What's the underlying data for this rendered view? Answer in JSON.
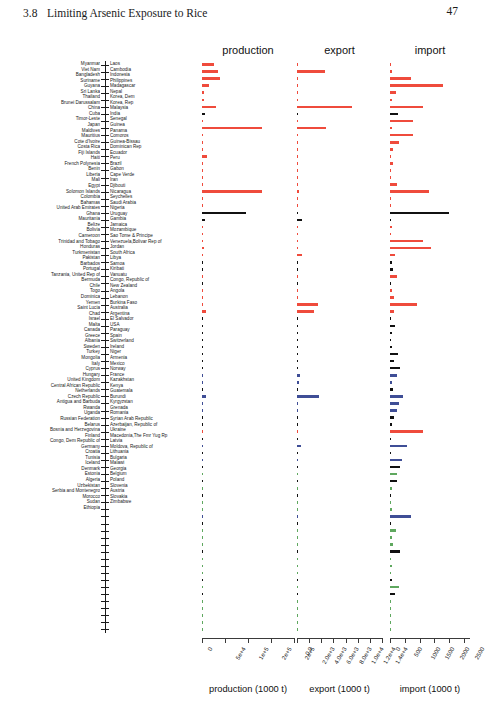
{
  "page": {
    "chapter_number": "3.8",
    "chapter_title": "Limiting Arsenic Exposure to Rice",
    "page_number": "47"
  },
  "figure": {
    "panels": [
      {
        "key": "production",
        "title": "production",
        "caption": "production (1000 t)"
      },
      {
        "key": "export",
        "title": "export",
        "caption": "export (1000 t)"
      },
      {
        "key": "import",
        "title": "import",
        "caption": "import (1000 t)"
      }
    ]
  },
  "chart_data": {
    "type": "bar",
    "orientation": "horizontal",
    "title": "",
    "subtitle": "",
    "panels": [
      {
        "name": "production",
        "xlabel": "production (1000 t)",
        "xlim": [
          0,
          200000
        ],
        "ticks": [
          0,
          50000,
          100000,
          150000,
          200000
        ],
        "ticklabels": [
          "0",
          "5e+4",
          "1e+5",
          "2e+5",
          "2e+5"
        ],
        "grid": false
      },
      {
        "name": "export",
        "xlabel": "export (1000 t)",
        "xlim": [
          0,
          14000
        ],
        "ticks": [
          0,
          2000,
          4000,
          6000,
          8000,
          10000,
          12000,
          14000
        ],
        "ticklabels": [
          "0.0",
          "2.0e+3",
          "4.0e+3",
          "6.0e+3",
          "8.0e+3",
          "1.0e+4",
          "1.2e+4",
          "1.4e+4"
        ],
        "grid": false
      },
      {
        "name": "import",
        "xlabel": "import (1000 t)",
        "xlim": [
          0,
          2700
        ],
        "ticks": [
          0,
          500,
          1000,
          1500,
          2000,
          2500
        ],
        "ticklabels": [
          "0",
          "500",
          "1000",
          "1500",
          "2000",
          "2500"
        ],
        "grid": false
      }
    ],
    "legend": {
      "position": "none",
      "entries": []
    },
    "colors": {
      "red": "#ef4b3c",
      "black": "#111111",
      "blue": "#3f4e96",
      "green": "#5fa85f"
    },
    "left_labels": [
      "Myanmar",
      "Viet Nam",
      "Bangladesh",
      "Suriname",
      "Guyana",
      "Sri Lanka",
      "Thailand",
      "Brunei Darussalam",
      "China",
      "Cuba",
      "Timor-Leste",
      "Japan",
      "Maldives",
      "Mauritius",
      "Cote d'Ivoire",
      "Costa Rica",
      "Fiji Islands",
      "Haiti",
      "French Polynesia",
      "Benin",
      "Liberia",
      "Mali",
      "Egypt",
      "Solomon Islands",
      "Colombia",
      "Bahamas",
      "United Arab Emirates",
      "Ghana",
      "Mauritania",
      "Belize",
      "Bolivia",
      "Cameroon",
      "Trinidad and Tobago",
      "Honduras",
      "Turkmenistan",
      "Pakistan",
      "Barbados",
      "Portugal",
      "Tanzania, United Rep of",
      "Bermuda",
      "Chile",
      "Togo",
      "Dominica",
      "Yemen",
      "Saint Lucia",
      "Chad",
      "Israel",
      "Malta",
      "Canada",
      "Greece",
      "Albania",
      "Sweden",
      "Turkey",
      "Mongolia",
      "Italy",
      "Cyprus",
      "Hungary",
      "United Kingdom",
      "Central African Republic",
      "Netherlands",
      "Czech Republic",
      "Antigua and Barbuda",
      "Rwanda",
      "Uganda",
      "Russian Federation",
      "Belarus",
      "Bosnia and Herzegovina",
      "Finland",
      "Congo, Dem Republic of",
      "Germany",
      "Croatia",
      "Tunisia",
      "Iceland",
      "Denmark",
      "Estonia",
      "Algeria",
      "Uzbekistan",
      "Serbia and Montenegro",
      "Morocco",
      "Sudan",
      "Ethiopia"
    ],
    "right_labels": [
      "Laos",
      "Cambodia",
      "Indonesia",
      "Philippines",
      "Madagascar",
      "Nepal",
      "Korea, Dem",
      "Korea, Rep",
      "Malaysia",
      "India",
      "Senegal",
      "Guinea",
      "Panama",
      "Comoros",
      "Guinea-Bissau",
      "Dominican Rep",
      "Ecuador",
      "Peru",
      "Brazil",
      "Gabon",
      "Cape Verde",
      "Iran",
      "Djibouti",
      "Nicaragua",
      "Seychelles",
      "Saudi Arabia",
      "Nigeria",
      "Uruguay",
      "Gambia",
      "Jamaica",
      "Mozambique",
      "Sao Tome & Principe",
      "Venezuela,Bolivar Rep of",
      "Jordan",
      "South Africa",
      "Libya",
      "Samoa",
      "Kiribati",
      "Vanuatu",
      "Congo, Republic of",
      "New Zealand",
      "Angola",
      "Lebanon",
      "Burkina Faso",
      "Australia",
      "Argentina",
      "El Salvador",
      "USA",
      "Paraguay",
      "Spain",
      "Switzerland",
      "Ireland",
      "Niger",
      "Armenia",
      "Mexico",
      "Norway",
      "France",
      "Kazakhstan",
      "Kenya",
      "Guatemala",
      "Burundi",
      "Kyrgyzstan",
      "Grenada",
      "Romania",
      "Syrian Arab Republic",
      "Azerbaijan, Republic of",
      "Ukraine",
      "Macedonia,The Fmr Yug Rp",
      "Latvia",
      "Moldova, Republic of",
      "Lithuania",
      "Bulgaria",
      "Malawi",
      "Georgia",
      "Belgium",
      "Poland",
      "Slovenia",
      "Austria",
      "Slovakia",
      "Zimbabwe"
    ],
    "rows": [
      {
        "left": "Myanmar",
        "right": "Laos",
        "color": "red",
        "production": 25200,
        "export": 60,
        "import": 30
      },
      {
        "left": "Viet Nam",
        "right": "Cambodia",
        "color": "red",
        "production": 35800,
        "export": 4600,
        "import": 80
      },
      {
        "left": "Bangladesh",
        "right": "Indonesia",
        "color": "red",
        "production": 40100,
        "export": 40,
        "import": 720
      },
      {
        "left": "Suriname",
        "right": "Philippines",
        "color": "red",
        "production": 15300,
        "export": 30,
        "import": 1800
      },
      {
        "left": "Guyana",
        "right": "Madagascar",
        "color": "red",
        "production": 3400,
        "export": 20,
        "import": 210
      },
      {
        "left": "Sri Lanka",
        "right": "Nepal",
        "color": "red",
        "production": 4200,
        "export": 15,
        "import": 70
      },
      {
        "left": "Thailand",
        "right": "Korea, Dem",
        "color": "red",
        "production": 29500,
        "export": 9000,
        "import": 1100
      },
      {
        "left": "Brunei Darussalam",
        "right": "Korea, Rep",
        "color": "black",
        "production": 6500,
        "export": 30,
        "import": 260
      },
      {
        "left": "China",
        "right": "Malaysia",
        "color": "red",
        "production": 2200,
        "export": 40,
        "import": 760
      },
      {
        "left": "Cuba",
        "right": "India",
        "color": "red",
        "production": 131000,
        "export": 4800,
        "import": 60
      },
      {
        "left": "Timor-Leste",
        "right": "Senegal",
        "color": "red",
        "production": 380,
        "export": 10,
        "import": 760
      },
      {
        "left": "Japan",
        "right": "Guinea",
        "color": "red",
        "production": 1400,
        "export": 5,
        "import": 290
      },
      {
        "left": "Maldives",
        "right": "Panama",
        "color": "red",
        "production": 330,
        "export": 5,
        "import": 100
      },
      {
        "left": "Mauritius",
        "right": "Comoros",
        "color": "red",
        "production": 11000,
        "export": 200,
        "import": 40
      },
      {
        "left": "Cote d'Ivoire",
        "right": "Guinea-Bissau",
        "color": "red",
        "production": 700,
        "export": 10,
        "import": 90
      },
      {
        "left": "Costa Rica",
        "right": "Dominican Rep",
        "color": "red",
        "production": 730,
        "export": 20,
        "import": 40
      },
      {
        "left": "Fiji Islands",
        "right": "Ecuador",
        "color": "red",
        "production": 1400,
        "export": 40,
        "import": 20
      },
      {
        "left": "Haiti",
        "right": "Peru",
        "color": "red",
        "production": 2400,
        "export": 30,
        "import": 220
      },
      {
        "left": "French Polynesia",
        "right": "Brazil",
        "color": "red",
        "production": 130000,
        "export": 300,
        "import": 1300
      },
      {
        "left": "Benin",
        "right": "Gabon",
        "color": "red",
        "production": 180,
        "export": 5,
        "import": 20
      },
      {
        "left": "Liberia",
        "right": "Cape Verde",
        "color": "red",
        "production": 210,
        "export": 5,
        "import": 30
      },
      {
        "left": "Mali",
        "right": "Iran",
        "color": "black",
        "production": 95000,
        "export": 120,
        "import": 2000
      },
      {
        "left": "Egypt",
        "right": "Djibouti",
        "color": "black",
        "production": 5900,
        "export": 900,
        "import": 30
      },
      {
        "left": "Solomon Islands",
        "right": "Nicaragua",
        "color": "red",
        "production": 300,
        "export": 10,
        "import": 70
      },
      {
        "left": "Colombia",
        "right": "Seychelles",
        "color": "red",
        "production": 2700,
        "export": 25,
        "import": 20
      },
      {
        "left": "Bahamas",
        "right": "Saudi Arabia",
        "color": "red",
        "production": 70,
        "export": 15,
        "import": 1100
      },
      {
        "left": "United Arab Emirates",
        "right": "Nigeria",
        "color": "red",
        "production": 3400,
        "export": 220,
        "import": 1400
      },
      {
        "left": "Ghana",
        "right": "Uruguay",
        "color": "red",
        "production": 1200,
        "export": 800,
        "import": 170
      },
      {
        "left": "Mauritania",
        "right": "Gambia",
        "color": "black",
        "production": 90,
        "export": 10,
        "import": 80
      },
      {
        "left": "Belize",
        "right": "Jamaica",
        "color": "black",
        "production": 40,
        "export": 5,
        "import": 110
      },
      {
        "left": "Bolivia",
        "right": "Mozambique",
        "color": "red",
        "production": 420,
        "export": 15,
        "import": 230
      },
      {
        "left": "Cameroon",
        "right": "Sao Tome & Principe",
        "color": "black",
        "production": 80,
        "export": 5,
        "import": 40
      },
      {
        "left": "Trinidad and Tobago",
        "right": "Venezuela,Bolivar Rep of",
        "color": "red",
        "production": 820,
        "export": 60,
        "import": 70
      },
      {
        "left": "Honduras",
        "right": "Jordan",
        "color": "red",
        "production": 40,
        "export": 10,
        "import": 130
      },
      {
        "left": "Turkmenistan",
        "right": "South Africa",
        "color": "red",
        "production": 140,
        "export": 3500,
        "import": 900
      },
      {
        "left": "Pakistan",
        "right": "Libya",
        "color": "red",
        "production": 8300,
        "export": 2800,
        "import": 120
      },
      {
        "left": "Barbados",
        "right": "Samoa",
        "color": "black",
        "production": 20,
        "export": 5,
        "import": 30
      },
      {
        "left": "Portugal",
        "right": "Kiribati",
        "color": "black",
        "production": 160,
        "export": 20,
        "import": 180
      },
      {
        "left": "Tanzania, United Rep of",
        "right": "Vanuatu",
        "color": "black",
        "production": 900,
        "export": 60,
        "import": 60
      },
      {
        "left": "Bermuda",
        "right": "Congo, Republic of",
        "color": "black",
        "production": 10,
        "export": 5,
        "import": 40
      },
      {
        "left": "Chile",
        "right": "New Zealand",
        "color": "black",
        "production": 130,
        "export": 10,
        "import": 60
      },
      {
        "left": "Togo",
        "right": "Angola",
        "color": "black",
        "production": 90,
        "export": 5,
        "import": 280
      },
      {
        "left": "Dominica",
        "right": "Lebanon",
        "color": "black",
        "production": 10,
        "export": 10,
        "import": 120
      },
      {
        "left": "Yemen",
        "right": "Burkina Faso",
        "color": "black",
        "production": 80,
        "export": 5,
        "import": 340
      },
      {
        "left": "Saint Lucia",
        "right": "Australia",
        "color": "blue",
        "production": 1000,
        "export": 500,
        "import": 220
      },
      {
        "left": "Chad",
        "right": "Argentina",
        "color": "blue",
        "production": 1000,
        "export": 400,
        "import": 70
      },
      {
        "left": "Israel",
        "right": "El Salvador",
        "color": "black",
        "production": 40,
        "export": 10,
        "import": 90
      },
      {
        "left": "Malta",
        "right": "USA",
        "color": "blue",
        "production": 9500,
        "export": 3600,
        "import": 430
      },
      {
        "left": "Canada",
        "right": "Paraguay",
        "color": "blue",
        "production": 120,
        "export": 60,
        "import": 290
      },
      {
        "left": "Greece",
        "right": "Spain",
        "color": "blue",
        "production": 800,
        "export": 180,
        "import": 220
      },
      {
        "left": "Albania",
        "right": "Switzerland",
        "color": "black",
        "production": 20,
        "export": 20,
        "import": 140
      },
      {
        "left": "Sweden",
        "right": "Ireland",
        "color": "black",
        "production": 10,
        "export": 10,
        "import": 80
      },
      {
        "left": "Turkey",
        "right": "Niger",
        "color": "red",
        "production": 400,
        "export": 30,
        "import": 1100
      },
      {
        "left": "Mongolia",
        "right": "Armenia",
        "color": "black",
        "production": 5,
        "export": 5,
        "import": 30
      },
      {
        "left": "Italy",
        "right": "Mexico",
        "color": "blue",
        "production": 1400,
        "export": 600,
        "import": 570
      },
      {
        "left": "Cyprus",
        "right": "Norway",
        "color": "black",
        "production": 5,
        "export": 5,
        "import": 30
      },
      {
        "left": "Hungary",
        "right": "France",
        "color": "blue",
        "production": 110,
        "export": 110,
        "import": 410
      },
      {
        "left": "United Kingdom",
        "right": "Kazakhstan",
        "color": "black",
        "production": 280,
        "export": 80,
        "import": 350
      },
      {
        "left": "Central African Republic",
        "right": "Kenya",
        "color": "green",
        "production": 40,
        "export": 10,
        "import": 230
      },
      {
        "left": "Netherlands",
        "right": "Guatemala",
        "color": "black",
        "production": 20,
        "export": 120,
        "import": 250
      },
      {
        "left": "Czech Republic",
        "right": "Burundi",
        "color": "green",
        "production": 60,
        "export": 10,
        "import": 60
      },
      {
        "left": "Antigua and Barbuda",
        "right": "Kyrgyzstan",
        "color": "black",
        "production": 20,
        "export": 5,
        "import": 40
      },
      {
        "left": "Rwanda",
        "right": "Grenada",
        "color": "green",
        "production": 60,
        "export": 10,
        "import": 30
      },
      {
        "left": "Uganda",
        "right": "Romania",
        "color": "green",
        "production": 150,
        "export": 30,
        "import": 80
      },
      {
        "left": "Russian Federation",
        "right": "Syrian Arab Republic",
        "color": "blue",
        "production": 600,
        "export": 30,
        "import": 720
      },
      {
        "left": "Belarus",
        "right": "Azerbaijan, Republic of",
        "color": "black",
        "production": 10,
        "export": 10,
        "import": 50
      },
      {
        "left": "Bosnia and Herzegovina",
        "right": "Ukraine",
        "color": "green",
        "production": 20,
        "export": 10,
        "import": 210
      },
      {
        "left": "Finland",
        "right": "Macedonia,The Fmr Yug Rp",
        "color": "green",
        "production": 15,
        "export": 10,
        "import": 60
      },
      {
        "left": "Congo, Dem Republic of",
        "right": "Latvia",
        "color": "green",
        "production": 320,
        "export": 10,
        "import": 90
      },
      {
        "left": "Germany",
        "right": "Moldova, Republic of",
        "color": "black",
        "production": 10,
        "export": 160,
        "import": 340
      },
      {
        "left": "Croatia",
        "right": "Lithuania",
        "color": "green",
        "production": 10,
        "export": 10,
        "import": 50
      },
      {
        "left": "Tunisia",
        "right": "Bulgaria",
        "color": "green",
        "production": 60,
        "export": 15,
        "import": 60
      },
      {
        "left": "Iceland",
        "right": "Malawi",
        "color": "green",
        "production": 5,
        "export": 5,
        "import": 30
      },
      {
        "left": "Denmark",
        "right": "Georgia",
        "color": "black",
        "production": 10,
        "export": 30,
        "import": 60
      },
      {
        "left": "Estonia",
        "right": "Belgium",
        "color": "green",
        "production": 5,
        "export": 60,
        "import": 290
      },
      {
        "left": "Algeria",
        "right": "Poland",
        "color": "black",
        "production": 10,
        "export": 40,
        "import": 160
      },
      {
        "left": "Uzbekistan",
        "right": "Slovenia",
        "color": "green",
        "production": 180,
        "export": 10,
        "import": 40
      },
      {
        "left": "Serbia and Montenegro",
        "right": "Austria",
        "color": "green",
        "production": 10,
        "export": 10,
        "import": 40
      },
      {
        "left": "Morocco",
        "right": "Slovakia",
        "color": "green",
        "production": 40,
        "export": 10,
        "import": 30
      },
      {
        "left": "Sudan",
        "right": "Zimbabwe",
        "color": "green",
        "production": 20,
        "export": 5,
        "import": 50
      },
      {
        "left": "Ethiopia",
        "right": "",
        "color": "green",
        "production": 10,
        "export": 5,
        "import": 30
      }
    ]
  }
}
